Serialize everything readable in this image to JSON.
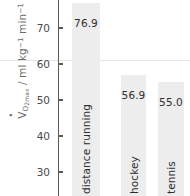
{
  "chart_data": {
    "type": "bar",
    "title": "",
    "subtitle": "",
    "xlabel": "",
    "ylabel": "VO2max / ml kg-1 min-1",
    "ylabel_parts": {
      "symbol": "V",
      "sub": "O",
      "sub2": "2max",
      "unit": " / ml kg",
      "sup1": "-1",
      "unit2": " min",
      "sup2": "-1"
    },
    "categories": [
      "distance running",
      "hockey",
      "tennis"
    ],
    "values": [
      76.9,
      56.9,
      55.0
    ],
    "value_labels": [
      "76.9",
      "56.9",
      "55.0"
    ],
    "yticks": [
      70,
      60,
      50,
      40,
      30
    ],
    "ytick_labels": [
      "70",
      "60",
      "50",
      "40",
      "30"
    ],
    "ylim": [
      26,
      78
    ],
    "grid": false,
    "legend": null,
    "reference_line": 61,
    "colors": {
      "bar_fill": "#ededed",
      "axis": "#5a5a5a",
      "tick_text": "#4a4a4a",
      "label_text": "#2e2e2e",
      "axis_title": "#6a6a6a",
      "reference_line": "#e6e6e6",
      "background": "#ffffff"
    }
  }
}
